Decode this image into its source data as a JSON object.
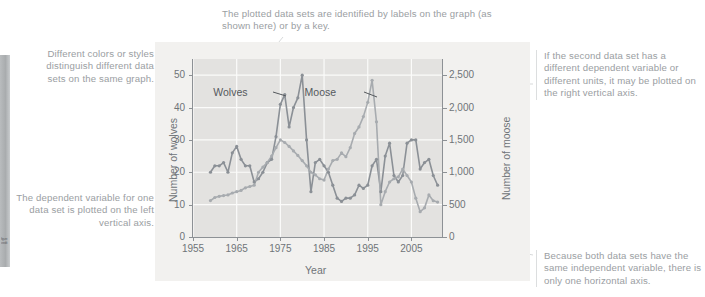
{
  "annotations": {
    "top": "The plotted data sets are identified by labels on the graph (as shown here) or by a key.",
    "left_top": "Different colors or styles distinguish different data sets on the same graph.",
    "left_bottom": "The dependent variable for one data set is plotted on the left vertical axis.",
    "right_top": "If the second data set has a different dependent variable or different units, it may be plotted on the right vertical axis.",
    "right_bottom": "Because both data sets have the same independent variable, there is only one horizontal axis."
  },
  "margin_bar": {
    "text": "figure credit"
  },
  "chart_data": {
    "type": "line",
    "title": "",
    "xlabel": "Year",
    "ylabel": "Number of wolves",
    "y2label": "Number of moose",
    "xlim": [
      1955,
      2012
    ],
    "ylim": [
      0,
      55
    ],
    "y2lim": [
      0,
      2750
    ],
    "xticks": [
      1955,
      1965,
      1975,
      1985,
      1995,
      2005
    ],
    "yticks": [
      0,
      10,
      20,
      30,
      40,
      50
    ],
    "y2ticks": [
      "0",
      "500",
      "1,000",
      "1,500",
      "2,000",
      "2,500"
    ],
    "y2tickvalues": [
      0,
      500,
      1000,
      1500,
      2000,
      2500
    ],
    "grid": true,
    "legend": "in-plot labels",
    "series": [
      {
        "name": "Wolves",
        "axis": "left",
        "color": "#8b9096",
        "label_pos": {
          "x": 1966.5,
          "y": 44.5
        },
        "x": [
          1959,
          1960,
          1961,
          1962,
          1963,
          1964,
          1965,
          1966,
          1967,
          1968,
          1969,
          1970,
          1971,
          1972,
          1973,
          1974,
          1975,
          1976,
          1977,
          1978,
          1979,
          1980,
          1981,
          1982,
          1983,
          1984,
          1985,
          1986,
          1987,
          1988,
          1989,
          1990,
          1991,
          1992,
          1993,
          1994,
          1995,
          1996,
          1997,
          1998,
          1999,
          2000,
          2001,
          2002,
          2003,
          2004,
          2005,
          2006,
          2007,
          2008,
          2009,
          2010,
          2011
        ],
        "y": [
          20,
          22,
          22,
          23,
          20,
          26,
          28,
          24,
          22,
          22,
          17,
          18,
          20,
          23,
          24,
          31,
          41,
          44,
          34,
          40,
          43,
          50,
          30,
          14,
          23,
          24,
          22,
          20,
          16,
          12,
          11,
          12,
          12,
          13,
          16,
          15,
          16,
          22,
          24,
          14,
          25,
          29,
          19,
          17,
          19,
          29,
          30,
          30,
          21,
          23,
          24,
          19,
          16
        ]
      },
      {
        "name": "Moose",
        "axis": "right",
        "color": "#a7abaf",
        "label_pos": {
          "x": 1986.5,
          "y": 44.5
        },
        "x": [
          1959,
          1960,
          1961,
          1962,
          1963,
          1964,
          1965,
          1966,
          1967,
          1968,
          1969,
          1970,
          1971,
          1972,
          1973,
          1974,
          1975,
          1976,
          1977,
          1978,
          1979,
          1980,
          1981,
          1982,
          1983,
          1984,
          1985,
          1986,
          1987,
          1988,
          1989,
          1990,
          1991,
          1992,
          1993,
          1994,
          1995,
          1996,
          1997,
          1998,
          1999,
          2000,
          2001,
          2002,
          2003,
          2004,
          2005,
          2006,
          2007,
          2008,
          2009,
          2010,
          2011
        ],
        "y": [
          563,
          610,
          628,
          640,
          650,
          680,
          700,
          720,
          760,
          780,
          800,
          1000,
          1080,
          1150,
          1250,
          1380,
          1500,
          1460,
          1400,
          1330,
          1260,
          1180,
          1100,
          1000,
          960,
          900,
          880,
          1050,
          1180,
          1200,
          1300,
          1240,
          1380,
          1600,
          1700,
          1860,
          2080,
          2420,
          1780,
          500,
          700,
          850,
          900,
          930,
          1050,
          950,
          850,
          600,
          390,
          450,
          650,
          560,
          540
        ]
      }
    ]
  }
}
